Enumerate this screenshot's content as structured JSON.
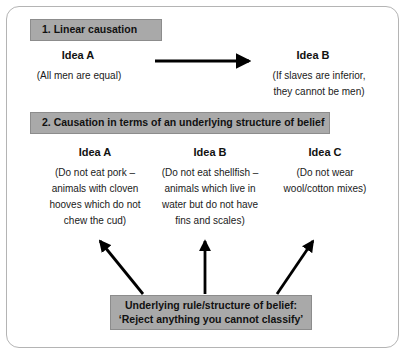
{
  "figure": {
    "sections": [
      {
        "id": "linear-causation",
        "header": "1. Linear causation",
        "ideas": [
          {
            "label": "Idea A",
            "lines": [
              "(All men are equal)"
            ]
          },
          {
            "label": "Idea B",
            "lines": [
              "(If slaves are inferior,",
              "they cannot be men)"
            ]
          }
        ]
      },
      {
        "id": "underlying-structure",
        "header": "2. Causation in terms of an underlying structure of belief",
        "ideas": [
          {
            "label": "Idea A",
            "lines": [
              "(Do not eat pork –",
              "animals with cloven",
              "hooves which do not",
              "chew the cud)"
            ]
          },
          {
            "label": "Idea B",
            "lines": [
              "(Do not eat shellfish –",
              "animals which live in",
              "water but do not have",
              "fins and scales)"
            ]
          },
          {
            "label": "Idea C",
            "lines": [
              "(Do not wear",
              "wool/cotton mixes)"
            ]
          }
        ],
        "rule_box": {
          "line1": "Underlying rule/structure of belief:",
          "line2": "‘Reject anything you cannot classify’"
        }
      }
    ],
    "arrows": {
      "linear": {
        "name": "arrow-idea-a-to-idea-b",
        "direction": "right"
      },
      "rule_arrows": [
        {
          "name": "arrow-rule-to-idea-a",
          "direction": "up-left"
        },
        {
          "name": "arrow-rule-to-idea-b",
          "direction": "up"
        },
        {
          "name": "arrow-rule-to-idea-c",
          "direction": "up-right"
        }
      ]
    },
    "colors": {
      "bar_fill": "#a9a9a9",
      "bar_border": "#8c8c8c",
      "frame_border": "#b4b4b4",
      "text": "#141414",
      "arrow": "#000000",
      "background": "#ffffff"
    }
  }
}
